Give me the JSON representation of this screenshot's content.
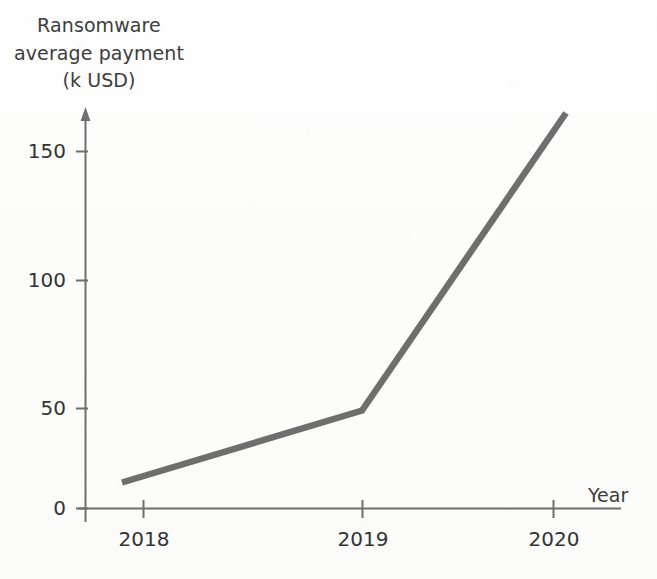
{
  "chart_data": {
    "type": "line",
    "title": "",
    "ylabel_lines": [
      "Ransomware",
      "average payment",
      "(k USD)"
    ],
    "ylabel": "Ransomware average payment (k USD)",
    "xlabel": "Year",
    "categories": [
      "2018",
      "2019",
      "2020"
    ],
    "x": [
      2018,
      2019,
      2020
    ],
    "values": [
      13,
      49,
      165
    ],
    "series": [
      {
        "name": "Ransomware average payment",
        "values": [
          13,
          49,
          165
        ]
      }
    ],
    "yticks": [
      0,
      50,
      100,
      150
    ],
    "ytick_labels": [
      "0",
      "50",
      "100",
      "150"
    ],
    "xtick_labels": [
      "2018",
      "2019",
      "2020"
    ],
    "ylim": [
      0,
      175
    ],
    "grid": false,
    "legend": false,
    "legend_position": "none",
    "units": "k USD",
    "line_color": "#6e6e6e",
    "axis_color": "#6f6f6f",
    "background_color": "#fdfdfc"
  },
  "axes": {
    "y_axis_arrow": true,
    "x_axis_arrow": false
  }
}
